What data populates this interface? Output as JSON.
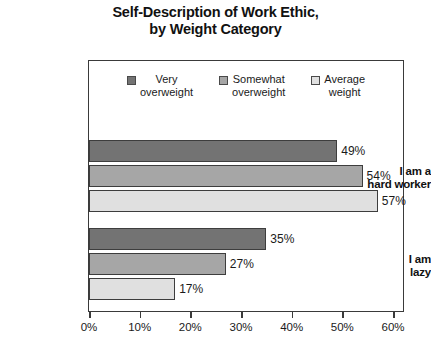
{
  "title": {
    "line1": "Self-Description of Work Ethic,",
    "line2": "by Weight Category"
  },
  "legend": {
    "items": [
      {
        "label_line1": "Very",
        "label_line2": "overweight",
        "color": "#737373"
      },
      {
        "label_line1": "Somewhat",
        "label_line2": "overweight",
        "color": "#a6a6a6"
      },
      {
        "label_line1": "Average",
        "label_line2": "weight",
        "color": "#e0e0e0"
      }
    ]
  },
  "axis": {
    "ticks": [
      "0%",
      "10%",
      "20%",
      "30%",
      "40%",
      "50%",
      "60%"
    ]
  },
  "categories": [
    {
      "line1": "I am a",
      "line2": "hard worker"
    },
    {
      "line1": "I am",
      "line2": "lazy"
    }
  ],
  "bars": {
    "hard_worker": [
      {
        "value_label": "49%",
        "value": 49,
        "color": "#737373"
      },
      {
        "value_label": "54%",
        "value": 54,
        "color": "#a6a6a6"
      },
      {
        "value_label": "57%",
        "value": 57,
        "color": "#e0e0e0"
      }
    ],
    "lazy": [
      {
        "value_label": "35%",
        "value": 35,
        "color": "#737373"
      },
      {
        "value_label": "27%",
        "value": 27,
        "color": "#a6a6a6"
      },
      {
        "value_label": "17%",
        "value": 17,
        "color": "#e0e0e0"
      }
    ]
  },
  "chart_data": {
    "type": "bar",
    "orientation": "horizontal",
    "title": "Self-Description of Work Ethic, by Weight Category",
    "xlabel": "",
    "ylabel": "",
    "xlim": [
      0,
      60
    ],
    "xticks": [
      0,
      10,
      20,
      30,
      40,
      50,
      60
    ],
    "xtick_labels": [
      "0%",
      "10%",
      "20%",
      "30%",
      "40%",
      "50%",
      "60%"
    ],
    "grid": false,
    "legend_position": "top-center",
    "categories": [
      "I am a hard worker",
      "I am lazy"
    ],
    "series": [
      {
        "name": "Very overweight",
        "values": [
          49,
          35
        ],
        "color": "#737373"
      },
      {
        "name": "Somewhat overweight",
        "values": [
          54,
          27
        ],
        "color": "#a6a6a6"
      },
      {
        "name": "Average weight",
        "values": [
          57,
          17
        ],
        "color": "#e0e0e0"
      }
    ],
    "data_labels": [
      "49%",
      "54%",
      "57%",
      "35%",
      "27%",
      "17%"
    ],
    "units": "percent"
  }
}
